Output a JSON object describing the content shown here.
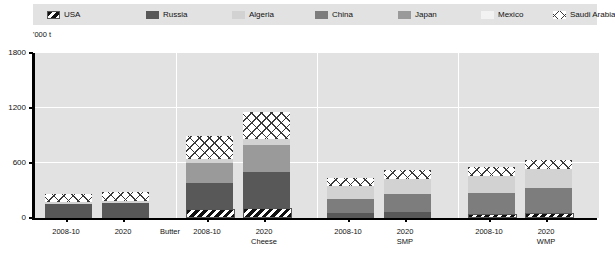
{
  "legend": {
    "items": [
      {
        "label": "USA",
        "key": "usa",
        "pattern": "diagonal-stripes",
        "color": "#ffffff"
      },
      {
        "label": "Russia",
        "key": "russia",
        "pattern": "solid",
        "color": "#585858"
      },
      {
        "label": "Algeria",
        "key": "algeria",
        "pattern": "solid",
        "color": "#d2d2d2"
      },
      {
        "label": "China",
        "key": "china",
        "pattern": "solid",
        "color": "#7d7d7d"
      },
      {
        "label": "Japan",
        "key": "japan",
        "pattern": "solid",
        "color": "#9a9a9a"
      },
      {
        "label": "Mexico",
        "key": "mexico",
        "pattern": "solid",
        "color": "#f2f2f2"
      },
      {
        "label": "Saudi Arabia",
        "key": "saudi",
        "pattern": "crosshatch",
        "color": "#ffffff"
      }
    ]
  },
  "axis": {
    "unit": "'000 t",
    "yticks": [
      0,
      600,
      1200,
      1800
    ]
  },
  "chart_data": {
    "type": "bar",
    "title": "",
    "xlabel": "",
    "ylabel": "'000 t",
    "ylim": [
      0,
      1800
    ],
    "grid": true,
    "stacked": true,
    "legend_position": "top",
    "groups": [
      "Butter",
      "Cheese",
      "SMP",
      "WMP"
    ],
    "categories": [
      "Butter 2008-10",
      "Butter 2020",
      "Cheese 2008-10",
      "Cheese 2020",
      "SMP 2008-10",
      "SMP 2020",
      "WMP 2008-10",
      "WMP 2020"
    ],
    "period_labels": [
      "2008-10",
      "2020"
    ],
    "series": [
      {
        "name": "USA",
        "key": "usa",
        "values": [
          0,
          0,
          75,
          85,
          0,
          0,
          25,
          30
        ]
      },
      {
        "name": "Russia",
        "key": "russia",
        "values": [
          150,
          160,
          290,
          390,
          60,
          65,
          0,
          0
        ]
      },
      {
        "name": "China",
        "key": "china",
        "values": [
          0,
          0,
          0,
          0,
          150,
          200,
          230,
          280
        ]
      },
      {
        "name": "Japan",
        "key": "japan",
        "values": [
          0,
          0,
          215,
          300,
          0,
          0,
          0,
          0
        ]
      },
      {
        "name": "Algeria",
        "key": "algeria",
        "values": [
          25,
          30,
          45,
          60,
          135,
          165,
          180,
          200
        ]
      },
      {
        "name": "Mexico",
        "key": "mexico",
        "values": [
          0,
          0,
          0,
          0,
          0,
          0,
          0,
          0
        ]
      },
      {
        "name": "Saudi Arabia",
        "key": "saudi",
        "values": [
          90,
          95,
          250,
          295,
          90,
          95,
          95,
          100
        ]
      }
    ],
    "totals": [
      265,
      285,
      875,
      1130,
      435,
      525,
      530,
      610
    ]
  }
}
